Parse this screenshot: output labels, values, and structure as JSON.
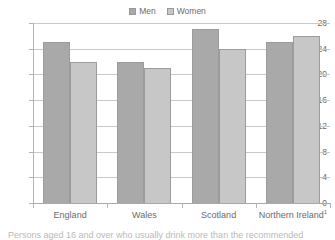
{
  "chart_data": {
    "type": "bar",
    "title": "",
    "subtitle": "",
    "xlabel": "",
    "ylabel": "",
    "categories": [
      "England",
      "Wales",
      "Scotland",
      "Northern Ireland¹"
    ],
    "series": [
      {
        "name": "Men",
        "color": "#a9a9a9",
        "values": [
          25,
          22,
          27,
          25
        ]
      },
      {
        "name": "Women",
        "color": "#c7c7c7",
        "values": [
          22,
          21,
          24,
          26
        ]
      }
    ],
    "ylim": [
      0,
      28
    ],
    "yticks": [
      0,
      4,
      8,
      12,
      16,
      20,
      24,
      28
    ],
    "ytick_labels": [
      "0",
      "4",
      "8",
      "12",
      "16",
      "20",
      "24",
      "28"
    ],
    "grid": true,
    "legend_position": "top-center"
  },
  "legend": {
    "entries": [
      {
        "label": "Men",
        "swatch": "men-swatch"
      },
      {
        "label": "Women",
        "swatch": "women-swatch"
      }
    ]
  },
  "footnote": {
    "clipped_caption": "Persons aged 16 and over who usually drink more than the recommended"
  }
}
